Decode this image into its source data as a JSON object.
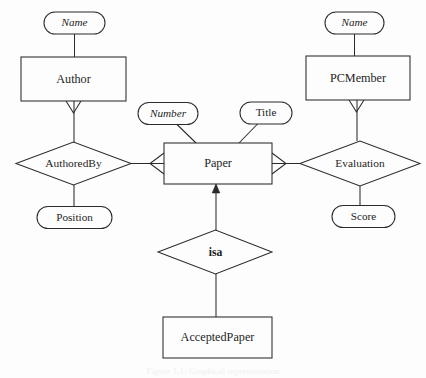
{
  "diagram": {
    "background_color": "#fdfdfd",
    "line_color": "#2b2b2b",
    "entities": [
      {
        "id": "author",
        "label": "Author",
        "x": 21,
        "y": 57,
        "w": 105,
        "h": 44
      },
      {
        "id": "pcmember",
        "label": "PCMember",
        "x": 306,
        "y": 56,
        "w": 104,
        "h": 44
      },
      {
        "id": "paper",
        "label": "Paper",
        "x": 164,
        "y": 143,
        "w": 108,
        "h": 41
      },
      {
        "id": "acceptedpaper",
        "label": "AcceptedPaper",
        "x": 163,
        "y": 317,
        "w": 109,
        "h": 41
      }
    ],
    "relationships": [
      {
        "id": "authoredby",
        "label": "AuthoredBy",
        "cx": 73.5,
        "cy": 163.5,
        "rx": 57.5,
        "ry": 21.5,
        "bold": false
      },
      {
        "id": "evaluation",
        "label": "Evaluation",
        "cx": 360,
        "cy": 163.5,
        "rx": 60,
        "ry": 22.5,
        "bold": false
      },
      {
        "id": "isa",
        "label": "isa",
        "cx": 215,
        "cy": 252,
        "rx": 57,
        "ry": 22,
        "bold": true
      }
    ],
    "attributes": [
      {
        "id": "author-name",
        "label": "Name",
        "key": true,
        "cx": 74.5,
        "cy": 23,
        "rx": 30.5,
        "ry": 11
      },
      {
        "id": "pcmember-name",
        "label": "Name",
        "key": true,
        "cx": 354.5,
        "cy": 23,
        "rx": 29.5,
        "ry": 11
      },
      {
        "id": "paper-number",
        "label": "Number",
        "key": true,
        "cx": 168,
        "cy": 113.5,
        "rx": 30,
        "ry": 11
      },
      {
        "id": "paper-title",
        "label": "Title",
        "key": false,
        "cx": 266,
        "cy": 113,
        "rx": 26,
        "ry": 11
      },
      {
        "id": "position",
        "label": "Position",
        "key": false,
        "cx": 74.5,
        "cy": 217.5,
        "rx": 37.5,
        "ry": 11
      },
      {
        "id": "score",
        "label": "Score",
        "key": false,
        "cx": 363.5,
        "cy": 216.5,
        "rx": 31.5,
        "ry": 11
      }
    ],
    "connections": [
      {
        "id": "name-to-author",
        "from": "author-name",
        "to": "author"
      },
      {
        "id": "author-to-authoredby",
        "from": "author",
        "to": "authoredby"
      },
      {
        "id": "authoredby-to-position",
        "from": "authoredby",
        "to": "position"
      },
      {
        "id": "authoredby-to-paper",
        "from": "authoredby",
        "to": "paper"
      },
      {
        "id": "name-to-pcmember",
        "from": "pcmember-name",
        "to": "pcmember"
      },
      {
        "id": "pcmember-to-evaluation",
        "from": "pcmember",
        "to": "evaluation"
      },
      {
        "id": "evaluation-to-score",
        "from": "evaluation",
        "to": "score"
      },
      {
        "id": "paper-to-evaluation",
        "from": "paper",
        "to": "evaluation"
      },
      {
        "id": "number-to-paper",
        "from": "paper-number",
        "to": "paper"
      },
      {
        "id": "title-to-paper",
        "from": "paper-title",
        "to": "paper"
      },
      {
        "id": "isa-to-paper",
        "from": "isa",
        "to": "paper"
      },
      {
        "id": "acceptedpaper-to-isa",
        "from": "acceptedpaper",
        "to": "isa"
      }
    ],
    "caption": "Figure 1.1: Graphical representation"
  }
}
